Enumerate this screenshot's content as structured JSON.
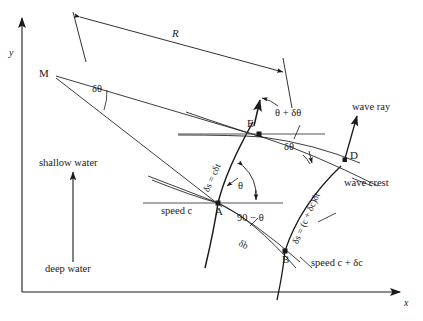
{
  "figure": {
    "axes": {
      "x_label": "x",
      "y_label": "y"
    },
    "points": [
      {
        "name": "M",
        "label": "M",
        "x": 52,
        "y": 74
      },
      {
        "name": "E",
        "label": "E",
        "x": 259,
        "y": 134
      },
      {
        "name": "D",
        "label": "D",
        "x": 345,
        "y": 160
      },
      {
        "name": "A",
        "label": "A",
        "x": 218,
        "y": 203
      },
      {
        "name": "B",
        "label": "B",
        "x": 285,
        "y": 251
      }
    ],
    "annotations": {
      "radius": "R",
      "delta_theta_M": "δθ",
      "delta_theta_E": "δθ",
      "theta_plus_delta_theta": "θ + δθ",
      "theta_at_A": "θ",
      "ninety_minus_theta": "90 − θ",
      "delta_s_A": "δs = cδt",
      "delta_s_B": "δs = (c + δc)δt",
      "delta_b": "δb",
      "speed_c": "speed c",
      "speed_c_plus_dc": "speed c + δc",
      "wave_ray": "wave ray",
      "wave_crest": "wave crest",
      "shallow_water": "shallow water",
      "deep_water": "deep water"
    },
    "colors": {
      "ink": "#1a1a1a",
      "line": "#222222",
      "thin_line": "#555555",
      "background": "#ffffff"
    }
  }
}
